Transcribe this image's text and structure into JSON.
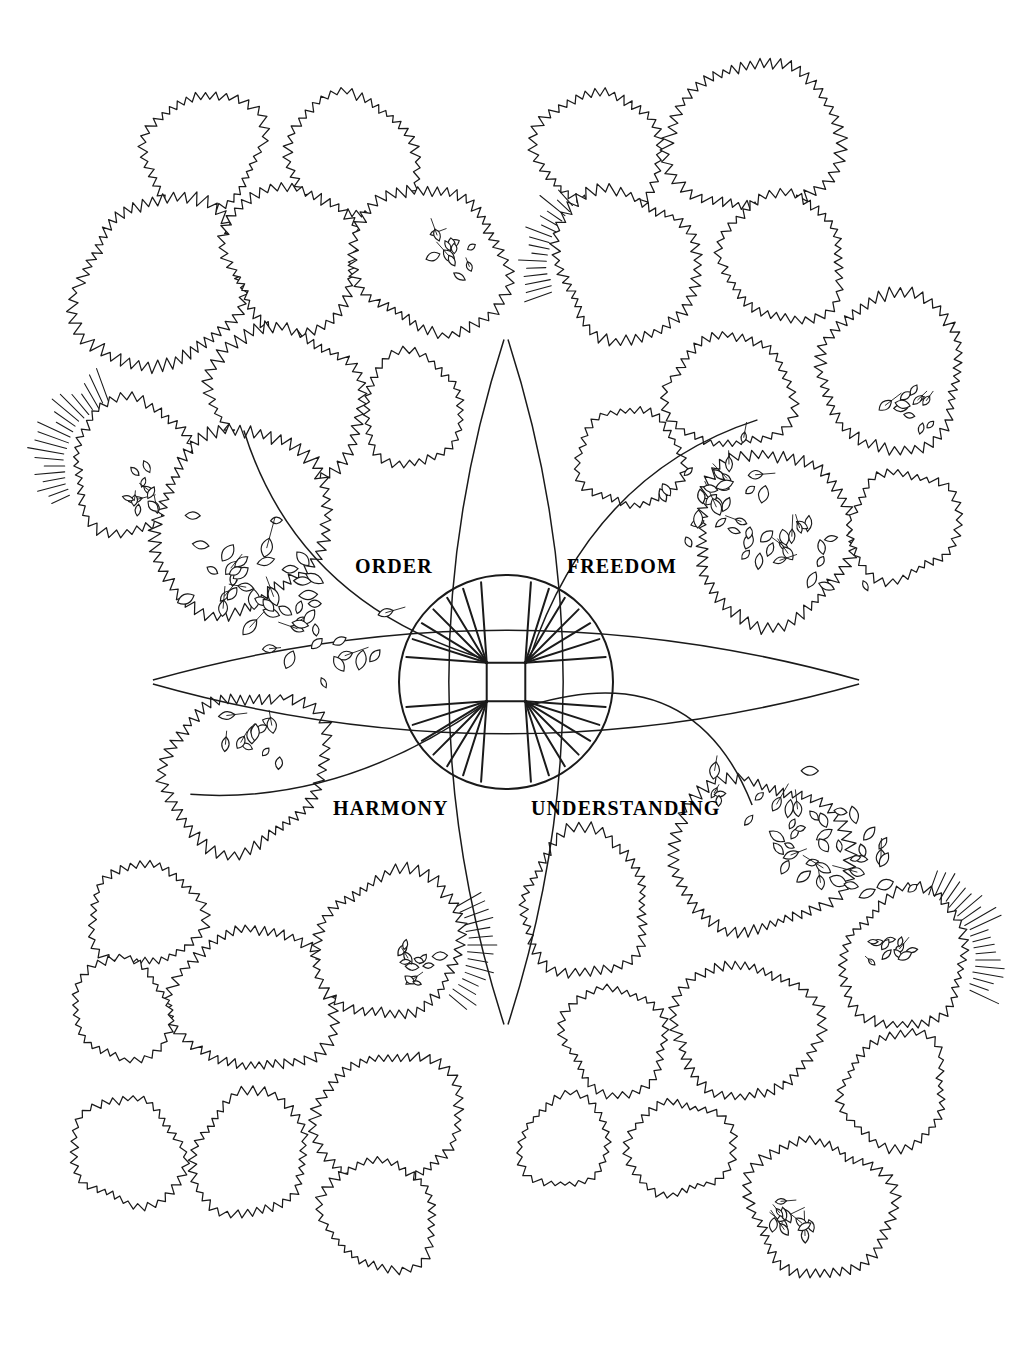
{
  "page": {
    "width": 1016,
    "height": 1357,
    "background_color": "#ffffff",
    "ink_color": "#1a1a1a",
    "style": "hand-drawn pen-and-ink site plan"
  },
  "emblem": {
    "name": "central-compass-emblem",
    "center_x": 506,
    "center_y": 682,
    "radius": 107,
    "ray_groups": 4,
    "rays_per_group": 7,
    "arc_count": 4,
    "description": "circle with four inner nodes radiating straight rays, crossed by four long vesica arcs"
  },
  "labels": {
    "order": "ORDER",
    "freedom": "FREEDOM",
    "harmony": "HARMONY",
    "understanding": "UNDERSTANDING"
  },
  "legend": {
    "quadrants": [
      {
        "key": "order",
        "label": "ORDER",
        "position": "top-left"
      },
      {
        "key": "freedom",
        "label": "FREEDOM",
        "position": "top-right"
      },
      {
        "key": "harmony",
        "label": "HARMONY",
        "position": "bottom-left"
      },
      {
        "key": "understanding",
        "label": "UNDERSTANDING",
        "position": "bottom-right"
      }
    ]
  },
  "trees": [
    {
      "cx": 203,
      "cy": 152,
      "r": 62,
      "seed": 11
    },
    {
      "cx": 352,
      "cy": 157,
      "r": 66,
      "seed": 23
    },
    {
      "cx": 160,
      "cy": 283,
      "r": 88,
      "seed": 37
    },
    {
      "cx": 292,
      "cy": 258,
      "r": 73,
      "seed": 41
    },
    {
      "cx": 430,
      "cy": 260,
      "r": 78,
      "seed": 53
    },
    {
      "cx": 287,
      "cy": 404,
      "r": 80,
      "seed": 67
    },
    {
      "cx": 412,
      "cy": 410,
      "r": 55,
      "seed": 71
    },
    {
      "cx": 132,
      "cy": 466,
      "r": 66,
      "seed": 83
    },
    {
      "cx": 240,
      "cy": 520,
      "r": 93,
      "seed": 97
    },
    {
      "cx": 600,
      "cy": 150,
      "r": 63,
      "seed": 101
    },
    {
      "cx": 755,
      "cy": 138,
      "r": 84,
      "seed": 103
    },
    {
      "cx": 626,
      "cy": 265,
      "r": 76,
      "seed": 107
    },
    {
      "cx": 783,
      "cy": 258,
      "r": 65,
      "seed": 109
    },
    {
      "cx": 892,
      "cy": 372,
      "r": 78,
      "seed": 113
    },
    {
      "cx": 730,
      "cy": 392,
      "r": 62,
      "seed": 127
    },
    {
      "cx": 630,
      "cy": 458,
      "r": 53,
      "seed": 131
    },
    {
      "cx": 773,
      "cy": 537,
      "r": 86,
      "seed": 137
    },
    {
      "cx": 903,
      "cy": 525,
      "r": 57,
      "seed": 139
    },
    {
      "cx": 245,
      "cy": 770,
      "r": 83,
      "seed": 149
    },
    {
      "cx": 145,
      "cy": 915,
      "r": 56,
      "seed": 151
    },
    {
      "cx": 255,
      "cy": 1000,
      "r": 80,
      "seed": 157
    },
    {
      "cx": 390,
      "cy": 945,
      "r": 76,
      "seed": 163
    },
    {
      "cx": 122,
      "cy": 1010,
      "r": 52,
      "seed": 167
    },
    {
      "cx": 128,
      "cy": 1152,
      "r": 57,
      "seed": 173
    },
    {
      "cx": 250,
      "cy": 1155,
      "r": 62,
      "seed": 179
    },
    {
      "cx": 388,
      "cy": 1120,
      "r": 73,
      "seed": 181
    },
    {
      "cx": 380,
      "cy": 1215,
      "r": 58,
      "seed": 191
    },
    {
      "cx": 585,
      "cy": 905,
      "r": 70,
      "seed": 193
    },
    {
      "cx": 758,
      "cy": 855,
      "r": 86,
      "seed": 197
    },
    {
      "cx": 615,
      "cy": 1040,
      "r": 55,
      "seed": 199
    },
    {
      "cx": 745,
      "cy": 1030,
      "r": 73,
      "seed": 211
    },
    {
      "cx": 905,
      "cy": 960,
      "r": 68,
      "seed": 223
    },
    {
      "cx": 895,
      "cy": 1090,
      "r": 57,
      "seed": 227
    },
    {
      "cx": 565,
      "cy": 1142,
      "r": 47,
      "seed": 229
    },
    {
      "cx": 680,
      "cy": 1148,
      "r": 52,
      "seed": 233
    },
    {
      "cx": 820,
      "cy": 1208,
      "r": 73,
      "seed": 239
    }
  ],
  "leaf_clusters": [
    {
      "name": "cluster-order",
      "cx": 278,
      "cy": 600,
      "count": 46,
      "spread": 78,
      "leaf_len": 15,
      "seed": 7
    },
    {
      "name": "cluster-freedom",
      "cx": 750,
      "cy": 520,
      "count": 44,
      "spread": 72,
      "leaf_len": 14,
      "seed": 13
    },
    {
      "name": "cluster-understanding",
      "cx": 810,
      "cy": 840,
      "count": 42,
      "spread": 72,
      "leaf_len": 14,
      "seed": 17
    },
    {
      "name": "cluster-harmony",
      "cx": 252,
      "cy": 745,
      "count": 12,
      "spread": 38,
      "leaf_len": 13,
      "seed": 19
    },
    {
      "name": "cluster-inset-tl",
      "cx": 148,
      "cy": 492,
      "count": 11,
      "spread": 30,
      "leaf_len": 12,
      "seed": 29
    },
    {
      "name": "cluster-inset-tl2",
      "cx": 447,
      "cy": 247,
      "count": 12,
      "spread": 30,
      "leaf_len": 12,
      "seed": 31
    },
    {
      "name": "cluster-inset-tr",
      "cx": 907,
      "cy": 404,
      "count": 11,
      "spread": 29,
      "leaf_len": 12,
      "seed": 43
    },
    {
      "name": "cluster-inset-bl",
      "cx": 421,
      "cy": 968,
      "count": 12,
      "spread": 30,
      "leaf_len": 12,
      "seed": 47
    },
    {
      "name": "cluster-inset-br",
      "cx": 889,
      "cy": 952,
      "count": 11,
      "spread": 29,
      "leaf_len": 12,
      "seed": 59
    },
    {
      "name": "cluster-inset-bot",
      "cx": 791,
      "cy": 1225,
      "count": 12,
      "spread": 30,
      "leaf_len": 12,
      "seed": 61
    }
  ],
  "hatch_groups": [
    {
      "name": "hatch-top-left",
      "cx": 132,
      "cy": 466,
      "r": 66,
      "start_deg": 155,
      "end_deg": 250,
      "count": 20,
      "len": 34,
      "seed": 3
    },
    {
      "name": "hatch-top-right",
      "cx": 626,
      "cy": 265,
      "r": 76,
      "start_deg": 160,
      "end_deg": 228,
      "count": 16,
      "len": 28,
      "seed": 5
    },
    {
      "name": "hatch-bottom-left",
      "cx": 390,
      "cy": 945,
      "r": 76,
      "start_deg": 330,
      "end_deg": 400,
      "count": 15,
      "len": 26,
      "seed": 9
    },
    {
      "name": "hatch-bottom-right",
      "cx": 905,
      "cy": 960,
      "r": 68,
      "start_deg": 290,
      "end_deg": 385,
      "count": 20,
      "len": 32,
      "seed": 15
    }
  ]
}
